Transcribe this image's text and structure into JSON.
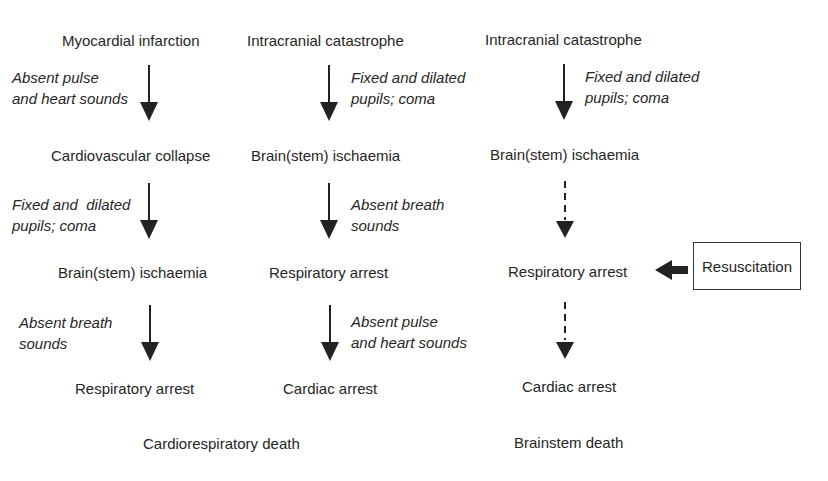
{
  "columns": [
    {
      "nodes": [
        "Myocardial infarction",
        "Cardiovascular collapse",
        "Brain(stem) ischaemia",
        "Respiratory arrest"
      ],
      "signs": [
        "Absent pulse\nand heart sounds",
        "Fixed and  dilated\npupils; coma",
        "Absent breath\nsounds"
      ]
    },
    {
      "nodes": [
        "Intracranial catastrophe",
        "Brain(stem) ischaemia",
        "Respiratory arrest",
        "Cardiac arrest"
      ],
      "signs": [
        "Fixed and dilated\npupils; coma",
        "Absent breath\nsounds",
        "Absent pulse\nand heart sounds"
      ]
    },
    {
      "nodes": [
        "Intracranial catastrophe",
        "Brain(stem) ischaemia",
        "Respiratory arrest",
        "Cardiac arrest"
      ],
      "signs": [
        "Fixed and dilated\npupils; coma"
      ]
    }
  ],
  "outcomes": {
    "left": "Cardiorespiratory death",
    "right": "Brainstem death"
  },
  "intervention": {
    "label": "Resuscitation"
  }
}
